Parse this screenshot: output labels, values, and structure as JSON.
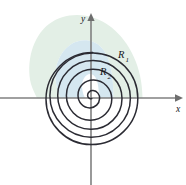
{
  "figure": {
    "background_color": "#ffffff",
    "axes": {
      "x_label": "x",
      "y_label": "y",
      "axis_color": "#808080",
      "origin": {
        "x": 91,
        "y": 98
      },
      "x_axis_start": 0,
      "x_axis_end": 186,
      "y_axis_start": 13,
      "y_axis_end": 185
    },
    "curve": {
      "name": "archimedean-spiral",
      "color": "#2b2b33",
      "stroke_width": 1.5,
      "turns": 2.5
    },
    "regions": [
      {
        "id": "R1",
        "label": "R",
        "subscript": "1",
        "fill_color": "#e3efe6",
        "label_x": 118,
        "label_y": 58
      },
      {
        "id": "R2",
        "label": "R",
        "subscript": "2",
        "fill_color": "#d5e7f0",
        "label_x": 100,
        "label_y": 75
      }
    ],
    "x_axis_crossings": [
      37,
      60,
      85,
      113,
      142
    ],
    "colors": {
      "region_1": "#e3efe6",
      "region_2": "#d5e7f0",
      "curve": "#2b2b33",
      "axis": "#808080",
      "text": "#15151c"
    }
  }
}
